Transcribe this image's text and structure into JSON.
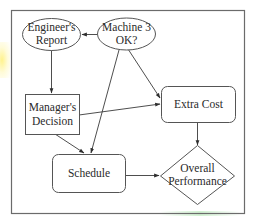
{
  "diagram": {
    "type": "influence-diagram",
    "colors": {
      "stroke": "#555555",
      "text": "#2a2a2a",
      "frame": "#6b6b6b",
      "background": "#ffffff"
    },
    "nodes": [
      {
        "id": "engineers_report",
        "shape": "ellipse",
        "lines": [
          "Engineer's",
          "Report"
        ]
      },
      {
        "id": "machine3_ok",
        "shape": "ellipse",
        "lines": [
          "Machine 3",
          "OK?"
        ]
      },
      {
        "id": "managers_decision",
        "shape": "rectangle",
        "lines": [
          "Manager's",
          "Decision"
        ]
      },
      {
        "id": "extra_cost",
        "shape": "rounded-rectangle",
        "lines": [
          "Extra Cost"
        ]
      },
      {
        "id": "schedule",
        "shape": "rounded-rectangle",
        "lines": [
          "Schedule"
        ]
      },
      {
        "id": "overall_performance",
        "shape": "diamond",
        "lines": [
          "Overall",
          "Performance"
        ]
      }
    ],
    "edges": [
      {
        "from": "machine3_ok",
        "to": "engineers_report"
      },
      {
        "from": "engineers_report",
        "to": "managers_decision"
      },
      {
        "from": "machine3_ok",
        "to": "extra_cost"
      },
      {
        "from": "machine3_ok",
        "to": "schedule"
      },
      {
        "from": "managers_decision",
        "to": "extra_cost"
      },
      {
        "from": "managers_decision",
        "to": "schedule"
      },
      {
        "from": "extra_cost",
        "to": "overall_performance"
      },
      {
        "from": "schedule",
        "to": "overall_performance"
      }
    ]
  }
}
